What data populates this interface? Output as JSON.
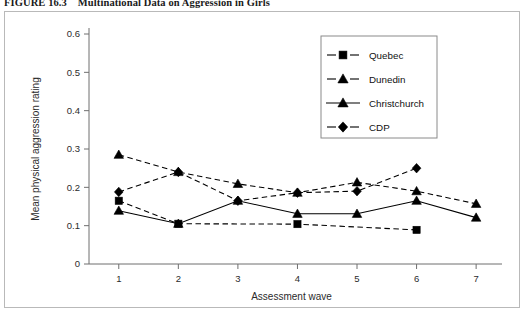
{
  "caption": {
    "figure_number": "FIGURE 16.3",
    "title": "Multinational Data on Aggression in Girls"
  },
  "chart_data": {
    "type": "line",
    "title": "",
    "xlabel": "Assessment wave",
    "ylabel": "Mean physical aggression rating",
    "x": [
      1,
      2,
      3,
      4,
      5,
      6,
      7
    ],
    "xlim": [
      0.5,
      7.3
    ],
    "ylim": [
      0,
      0.6
    ],
    "xticklabels": [
      "1",
      "2",
      "3",
      "4",
      "5",
      "6",
      "7"
    ],
    "yticklabels": [
      "0",
      "0.1",
      "0.2",
      "0.3",
      "0.4",
      "0.5",
      "0.6"
    ],
    "yticks": [
      0,
      0.1,
      0.2,
      0.3,
      0.4,
      0.5,
      0.6
    ],
    "grid": false,
    "legend_position": "upper right",
    "series": [
      {
        "name": "Quebec",
        "marker": "square",
        "linestyle": "dashed",
        "x": [
          1,
          2,
          4,
          6
        ],
        "values": [
          0.165,
          0.105,
          0.104,
          0.089
        ]
      },
      {
        "name": "Dunedin",
        "marker": "triangle",
        "linestyle": "dashed",
        "x": [
          1,
          2,
          3,
          4,
          5,
          6,
          7
        ],
        "values": [
          0.285,
          0.24,
          0.209,
          0.186,
          0.213,
          0.19,
          0.157
        ]
      },
      {
        "name": "Christchurch",
        "marker": "triangle",
        "linestyle": "solid",
        "x": [
          1,
          2,
          3,
          4,
          5,
          6,
          7
        ],
        "values": [
          0.139,
          0.105,
          0.165,
          0.131,
          0.131,
          0.165,
          0.121
        ]
      },
      {
        "name": "CDP",
        "marker": "diamond",
        "linestyle": "dashed",
        "x": [
          1,
          2,
          3,
          4,
          5,
          6
        ],
        "values": [
          0.188,
          0.24,
          0.165,
          0.186,
          0.19,
          0.25
        ]
      }
    ]
  },
  "legend": {
    "entries": [
      {
        "label": "Quebec",
        "marker": "square",
        "linestyle": "dashed"
      },
      {
        "label": "Dunedin",
        "marker": "triangle",
        "linestyle": "dashed"
      },
      {
        "label": "Christchurch",
        "marker": "triangle",
        "linestyle": "solid"
      },
      {
        "label": "CDP",
        "marker": "diamond",
        "linestyle": "dashed"
      }
    ]
  },
  "colors": {
    "ink": "#000000",
    "axis": "#6f6f6f",
    "frame": "#b9b9b9",
    "background": "#ffffff"
  }
}
